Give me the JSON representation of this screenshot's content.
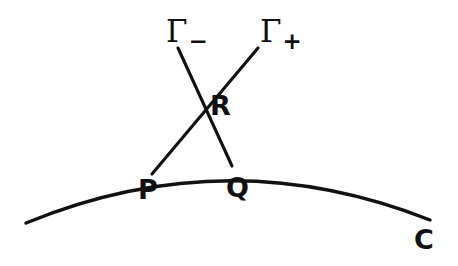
{
  "figure": {
    "kind": "geometric-diagram",
    "background_color": "#ffffff",
    "stroke_color": "#111111",
    "stroke_width": 3,
    "width": 458,
    "height": 266
  },
  "labels": {
    "gamma_minus": {
      "base": "Γ",
      "sub": "−",
      "text": "Γ−"
    },
    "gamma_plus": {
      "base": "Γ",
      "sub": "+",
      "text": "Γ+"
    },
    "point_R": "R",
    "point_P": "P",
    "point_Q": "Q",
    "curve_C": "C"
  },
  "geometry": {
    "curve_C": {
      "name": "C",
      "type": "arc",
      "start": [
        26,
        223
      ],
      "control": [
        228,
        140
      ],
      "end": [
        430,
        220
      ],
      "apex": [
        252,
        163
      ]
    },
    "line_gamma_minus": {
      "name": "Γ−",
      "from": [
        178,
        48
      ],
      "through_R": [
        205,
        100
      ],
      "to_Q": [
        232,
        166
      ]
    },
    "line_gamma_plus": {
      "name": "Γ+",
      "from": [
        258,
        48
      ],
      "through_R": [
        205,
        100
      ],
      "to_P": [
        152,
        174
      ]
    },
    "points": {
      "R": [
        205,
        100
      ],
      "P": [
        152,
        174
      ],
      "Q": [
        232,
        166
      ]
    }
  }
}
